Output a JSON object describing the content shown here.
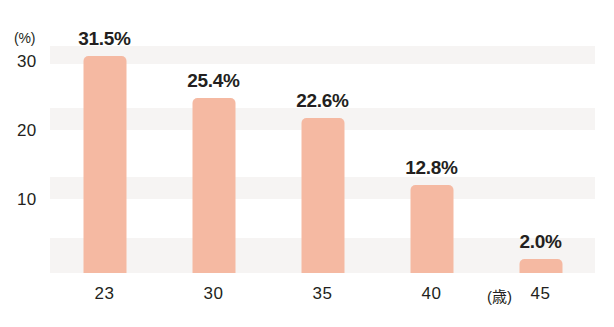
{
  "chart_data": {
    "type": "bar",
    "title": "",
    "subtitle": "",
    "xlabel": "(歳)",
    "ylabel": "(%)",
    "categories": [
      "23",
      "30",
      "35",
      "40",
      "45"
    ],
    "values": [
      31.5,
      25.4,
      22.6,
      12.8,
      2.0
    ],
    "data_labels": [
      "31.5%",
      "25.4%",
      "22.6%",
      "12.8%",
      "2.0%"
    ],
    "series": [
      {
        "name": "",
        "values": [
          31.5,
          25.4,
          22.6,
          12.8,
          2.0
        ]
      }
    ],
    "ylim": [
      0,
      33
    ],
    "yticks": [
      10,
      20,
      30
    ],
    "ytick_labels": [
      "10",
      "20",
      "30"
    ],
    "xtick_labels": [
      "23",
      "30",
      "35",
      "40",
      "45"
    ],
    "grid": false,
    "legend": false,
    "legend_position": "none",
    "bar_color": "#f5b9a2",
    "text_color": "#231f20",
    "band_color": "#f6f4f3",
    "background": "#ffffff"
  },
  "axes": {
    "y_unit": "(%)",
    "y_ticks": [
      {
        "label": "30"
      },
      {
        "label": "20"
      },
      {
        "label": "10"
      }
    ],
    "x_unit": "(歳)",
    "x_ticks": [
      {
        "label": "23"
      },
      {
        "label": "30"
      },
      {
        "label": "35"
      },
      {
        "label": "40"
      },
      {
        "label": "45"
      }
    ]
  },
  "bars": [
    {
      "label": "31.5%",
      "value": 31.5,
      "category": "23"
    },
    {
      "label": "25.4%",
      "value": 25.4,
      "category": "30"
    },
    {
      "label": "22.6%",
      "value": 22.6,
      "category": "35"
    },
    {
      "label": "12.8%",
      "value": 12.8,
      "category": "40"
    },
    {
      "label": "2.0%",
      "value": 2.0,
      "category": "45"
    }
  ]
}
